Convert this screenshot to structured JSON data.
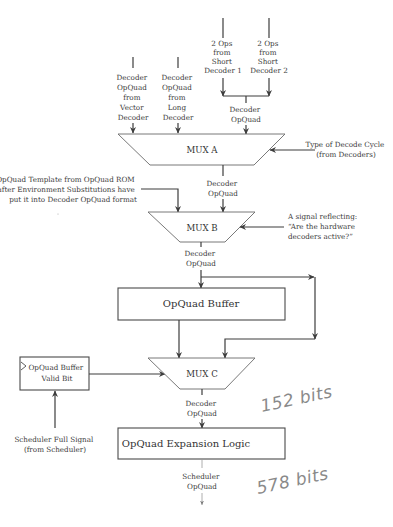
{
  "inputs": {
    "vector": [
      "Decoder",
      "OpQuad",
      "from",
      "Vector",
      "Decoder"
    ],
    "long": [
      "Decoder",
      "OpQuad",
      "from",
      "Long",
      "Decoder"
    ],
    "short1": [
      "2 Ops",
      "from",
      "Short",
      "Decoder 1"
    ],
    "short2": [
      "2 Ops",
      "from",
      "Short",
      "Decoder 2"
    ],
    "short_merged": [
      "Decoder",
      "OpQuad"
    ]
  },
  "mux_a": {
    "label": "MUX A",
    "control": [
      "Type of Decode Cycle",
      "(from Decoders)"
    ],
    "output": [
      "Decoder",
      "OpQuad"
    ]
  },
  "rom_input": [
    "OpQuad Template from OpQuad ROM",
    "after Environment Substitutions have",
    "put it into Decoder OpQuad format"
  ],
  "mux_b": {
    "label": "MUX B",
    "control": [
      "A signal reflecting:",
      "“Are the hardware",
      "decoders active?”"
    ],
    "output": [
      "Decoder",
      "OpQuad"
    ]
  },
  "buffer": {
    "label": "OpQuad Buffer"
  },
  "valid_bit": {
    "label": [
      "OpQuad Buffer",
      "Valid Bit"
    ]
  },
  "scheduler_signal": [
    "Scheduler Full Signal",
    "(from Scheduler)"
  ],
  "mux_c": {
    "label": "MUX C",
    "output": [
      "Decoder",
      "OpQuad"
    ]
  },
  "expansion": {
    "label": "OpQuad Expansion Logic"
  },
  "final_output": [
    "Scheduler",
    "OpQuad"
  ],
  "annotations": {
    "bits_in": "152 bits",
    "bits_out": "578 bits"
  },
  "colors": {
    "line": "#3d3d3d",
    "text": "#3a3a3a",
    "handwriting": "#8a8a8a"
  }
}
